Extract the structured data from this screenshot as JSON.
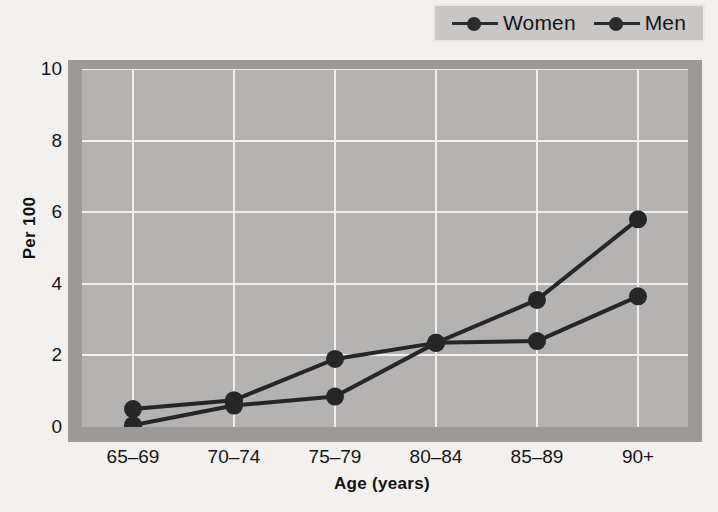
{
  "chart_data": {
    "type": "line",
    "title": "",
    "xlabel": "Age (years)",
    "ylabel": "Per 100",
    "categories": [
      "65–69",
      "70–74",
      "75–79",
      "80–84",
      "85–89",
      "90+"
    ],
    "series": [
      {
        "name": "Women",
        "values": [
          0.5,
          0.75,
          1.9,
          2.35,
          3.55,
          5.8
        ]
      },
      {
        "name": "Men",
        "values": [
          0.05,
          0.6,
          0.85,
          2.35,
          2.4,
          3.65
        ]
      }
    ],
    "ylim": [
      0,
      10
    ],
    "yticks": [
      "0",
      "2",
      "4",
      "6",
      "8",
      "10"
    ],
    "ytick_values": [
      0,
      2,
      4,
      6,
      8,
      10
    ],
    "grid": true,
    "legend_position": "top-right",
    "colors": {
      "series": "#262626",
      "plot_background": "#b4b3b1",
      "plot_border": "#9b9a98",
      "gridline": "#f0efed",
      "page_background": "#f2f1ef",
      "legend_background": "#c8c7c5"
    }
  },
  "legend": {
    "entries": [
      {
        "label": "Women",
        "marker": "filled-circle"
      },
      {
        "label": "Men",
        "marker": "filled-circle"
      }
    ]
  },
  "axes": {
    "y_title": "Per 100",
    "x_title": "Age (years)"
  }
}
